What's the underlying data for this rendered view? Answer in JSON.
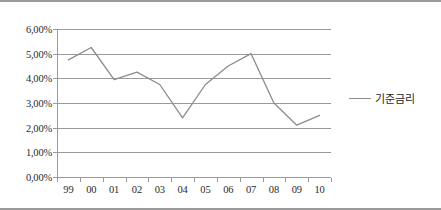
{
  "chart_data": {
    "type": "line",
    "title": "",
    "subtitle": "",
    "xlabel": "",
    "ylabel": "",
    "categories": [
      "99",
      "00",
      "01",
      "02",
      "03",
      "04",
      "05",
      "06",
      "07",
      "08",
      "09",
      "10"
    ],
    "series": [
      {
        "name": "기준금리",
        "color": "#8c8c8c",
        "values": [
          4.75,
          5.25,
          3.95,
          4.25,
          3.75,
          2.4,
          3.75,
          4.5,
          5.0,
          3.0,
          2.1,
          2.5
        ]
      }
    ],
    "ylim": [
      0.0,
      6.0
    ],
    "ytick_values": [
      0.0,
      1.0,
      2.0,
      3.0,
      4.0,
      5.0,
      6.0
    ],
    "ytick_labels": [
      "0,00%",
      "1,00%",
      "2,00%",
      "3,00%",
      "4,00%",
      "5,00%",
      "6,00%"
    ],
    "grid": true,
    "grid_axis": "y",
    "legend": true,
    "legend_position": "right",
    "legend_entries": [
      "기준금리"
    ],
    "markers": false,
    "annotations": []
  },
  "figure": {
    "border_color": "#9a9a9a",
    "background": "#ffffff",
    "gridline_color": "#9a9a9a",
    "axis_color": "#9a9a9a",
    "tick_label_color": "#2a2a2a"
  }
}
